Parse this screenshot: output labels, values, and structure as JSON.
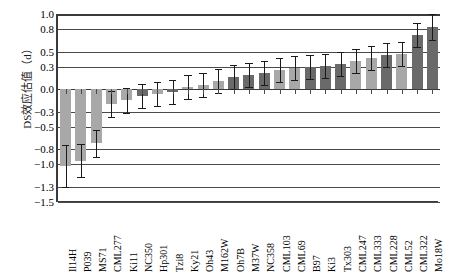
{
  "chart_data": {
    "type": "bar",
    "title": "",
    "xlabel": "",
    "ylabel": "DS效应估值（d）",
    "ylim": [
      -1.5,
      1.0
    ],
    "grid": true,
    "legend": null,
    "ytick_labels": [
      "1.0",
      "0.8",
      "0.5",
      "0.3",
      "0.0",
      "-0.3",
      "-0.5",
      "-0.8",
      "-1.0",
      "-1.3",
      "-1.5"
    ],
    "ytick_values": [
      1.0,
      0.8,
      0.5,
      0.3,
      0.0,
      -0.3,
      -0.5,
      -0.8,
      -1.0,
      -1.3,
      -1.5
    ],
    "categories": [
      "Il14H",
      "P039",
      "MS71",
      "CML277",
      "Ki11",
      "NC350",
      "Hp301",
      "Tzi8",
      "Ky21",
      "Oh43",
      "M162W",
      "Oh7B",
      "M37W",
      "NC358",
      "CML103",
      "CML69",
      "B97",
      "Ki3",
      "Tx303",
      "CML247",
      "CML333",
      "CML228",
      "CML52",
      "CML322",
      "Mo18W"
    ],
    "values": [
      -1.02,
      -0.95,
      -0.72,
      -0.2,
      -0.15,
      -0.09,
      -0.06,
      -0.04,
      0.03,
      0.06,
      0.11,
      0.16,
      0.19,
      0.22,
      0.25,
      0.28,
      0.3,
      0.31,
      0.33,
      0.38,
      0.41,
      0.46,
      0.47,
      0.72,
      0.83
    ],
    "errors": [
      0.28,
      0.22,
      0.18,
      0.17,
      0.16,
      0.16,
      0.16,
      0.16,
      0.16,
      0.16,
      0.16,
      0.16,
      0.16,
      0.16,
      0.16,
      0.16,
      0.16,
      0.16,
      0.16,
      0.16,
      0.16,
      0.16,
      0.16,
      0.16,
      0.17
    ],
    "bar_shades": [
      "light",
      "light",
      "light",
      "light",
      "light",
      "dark",
      "light",
      "dark",
      "light",
      "light",
      "light",
      "dark",
      "dark",
      "dark",
      "light",
      "light",
      "dark",
      "dark",
      "dark",
      "light",
      "light",
      "dark",
      "light",
      "dark",
      "dark"
    ],
    "colors": {
      "light_bar": "#a8a8a8",
      "dark_bar": "#6a6a6a",
      "axis": "#3a3a3a",
      "gridline": "#4a4a4a",
      "errorbar": "#1a1a1a"
    }
  }
}
